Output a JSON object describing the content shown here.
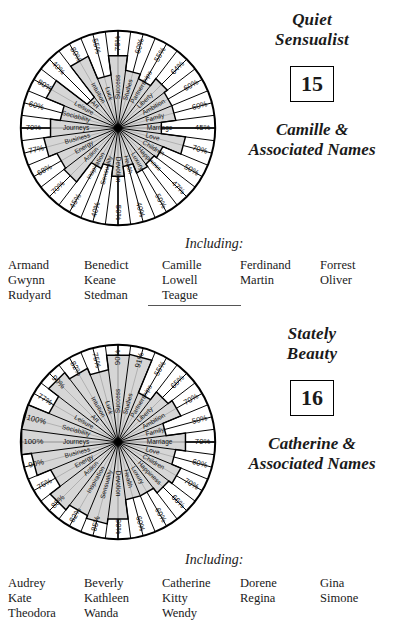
{
  "page": {
    "background": "#ffffff",
    "fill_color": "#cfcfcf",
    "line_color": "#000000"
  },
  "panels": [
    {
      "id": "panel-1",
      "title_top": "Quiet\nSensualist",
      "title_top_line1": "Quiet",
      "title_top_line2": "Sensualist",
      "number": "15",
      "title_bottom_line1": "Camille &",
      "title_bottom_line2": "Associated Names",
      "including_label": "Including:",
      "name_columns": [
        [
          "Armand",
          "Gwynn",
          "Rudyard"
        ],
        [
          "Benedict",
          "Keane",
          "Stedman"
        ],
        [
          "Camille",
          "Lowell",
          "Teague"
        ],
        [
          "Ferdinand",
          "Martin",
          ""
        ],
        [
          "Forrest",
          "Oliver",
          ""
        ]
      ],
      "chart_data": {
        "type": "radar",
        "title": "Quiet Sensualist",
        "ylim": [
          0,
          100
        ],
        "grid": true,
        "legend": "none",
        "categories": [
          "Success",
          "Studies",
          "Partnerships",
          "Liberty",
          "Ambition",
          "Family",
          "Marriage",
          "Love",
          "Children",
          "Happiness",
          "Luxury",
          "Health",
          "Devotion",
          "Sensuality",
          "Inspiration",
          "Action",
          "Energy",
          "Business",
          "Journeys",
          "Sociability",
          "Leisure",
          "Art",
          "Intuition",
          "Luck"
        ],
        "values": [
          75,
          60,
          55,
          64,
          60,
          60,
          45,
          70,
          50,
          47,
          50,
          40,
          50,
          40,
          45,
          70,
          68,
          77,
          70,
          60,
          80,
          40,
          80,
          55
        ],
        "tick_labels": [
          "75%",
          "60%",
          "55%",
          "64%",
          "60%",
          "60%",
          "45%",
          "70%",
          "50%",
          "47%",
          "50%",
          "40%",
          "50%",
          "40%",
          "45%",
          "70%",
          "68%",
          "77%",
          "70%",
          "60%",
          "80%",
          "40%",
          "80%",
          "55%"
        ]
      }
    },
    {
      "id": "panel-2",
      "title_top_line1": "Stately",
      "title_top_line2": "Beauty",
      "number": "16",
      "title_bottom_line1": "Catherine &",
      "title_bottom_line2": "Associated Names",
      "including_label": "Including:",
      "name_columns": [
        [
          "Audrey",
          "Kate",
          "Theodora"
        ],
        [
          "Beverly",
          "Kathleen",
          "Wanda"
        ],
        [
          "Catherine",
          "Kitty",
          "Wendy"
        ],
        [
          "Dorene",
          "Regina",
          ""
        ],
        [
          "Gina",
          "Simone",
          ""
        ]
      ],
      "chart_data": {
        "type": "radar",
        "title": "Stately Beauty",
        "ylim": [
          0,
          100
        ],
        "grid": true,
        "legend": "none",
        "categories": [
          "Success",
          "Studies",
          "Partnerships",
          "Liberty",
          "Ambition",
          "Family",
          "Marriage",
          "Love",
          "Children",
          "Happiness",
          "Luxury",
          "Health",
          "Devotion",
          "Sensuality",
          "Inspiration",
          "Action",
          "Energy",
          "Business",
          "Journeys",
          "Sociability",
          "Leisure",
          "Art",
          "Intuition",
          "Luck"
        ],
        "values": [
          90,
          91,
          55,
          65,
          70,
          50,
          70,
          60,
          70,
          66,
          60,
          60,
          80,
          85,
          82,
          88,
          75,
          90,
          100,
          100,
          77,
          90,
          82,
          75
        ],
        "tick_labels": [
          "90%",
          "91%",
          "55%",
          "65%",
          "70%",
          "50%",
          "70%",
          "60%",
          "70%",
          "66%",
          "60%",
          "60%",
          "80%",
          "85%",
          "82%",
          "88%",
          "75%",
          "90%",
          "100%",
          "100%",
          "77%",
          "90%",
          "82%",
          "75%"
        ]
      }
    }
  ]
}
